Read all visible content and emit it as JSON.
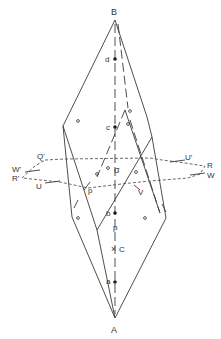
{
  "diagram": {
    "title": "",
    "colors": {
      "line": "#3a3a3a",
      "text": "#333333",
      "background": "#ffffff"
    },
    "vertices": {
      "B": {
        "label": "B",
        "x": 115,
        "y": 20
      },
      "A": {
        "label": "A",
        "x": 115,
        "y": 318
      }
    },
    "axis_points": [
      {
        "label": "d",
        "x": 115,
        "y": 59,
        "marker": "dot"
      },
      {
        "label": "c",
        "x": 115,
        "y": 127,
        "marker": "dot"
      },
      {
        "label": "σ",
        "x": 115,
        "y": 170,
        "marker": "none"
      },
      {
        "label": "b",
        "x": 115,
        "y": 213,
        "marker": "dot"
      },
      {
        "label": "p",
        "x": 115,
        "y": 227,
        "marker": "none"
      },
      {
        "label": "C",
        "x": 115,
        "y": 249,
        "marker": "cross"
      },
      {
        "label": "a",
        "x": 115,
        "y": 282,
        "marker": "dot"
      }
    ],
    "plane_labels": [
      {
        "label": "Q'",
        "x": 38,
        "y": 159
      },
      {
        "label": "W'",
        "x": 14,
        "y": 170
      },
      {
        "label": "R'",
        "x": 14,
        "y": 179
      },
      {
        "label": "U",
        "x": 38,
        "y": 187
      },
      {
        "label": "p",
        "x": 88,
        "y": 192
      },
      {
        "label": "V",
        "x": 140,
        "y": 193
      },
      {
        "label": "U'",
        "x": 186,
        "y": 160
      },
      {
        "label": "R",
        "x": 208,
        "y": 166
      },
      {
        "label": "W",
        "x": 208,
        "y": 176
      }
    ],
    "small_circles": [
      {
        "x": 78,
        "y": 121
      },
      {
        "x": 130,
        "y": 111
      },
      {
        "x": 128,
        "y": 124
      },
      {
        "x": 97,
        "y": 174
      },
      {
        "x": 108,
        "y": 168
      },
      {
        "x": 136,
        "y": 172
      },
      {
        "x": 78,
        "y": 218
      },
      {
        "x": 145,
        "y": 218
      },
      {
        "x": 115,
        "y": 227
      }
    ]
  }
}
